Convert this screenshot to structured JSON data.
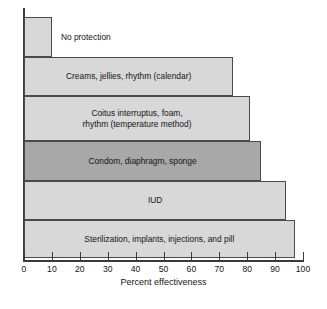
{
  "chart_data": {
    "type": "bar",
    "orientation": "horizontal",
    "title": "",
    "xlabel": "Percent effectiveness",
    "ylabel": "",
    "xlim": [
      0,
      100
    ],
    "xticks": [
      0,
      10,
      20,
      30,
      40,
      50,
      60,
      70,
      80,
      90,
      100
    ],
    "xtick_labels": [
      "0",
      "10",
      "20",
      "30",
      "40",
      "50",
      "60",
      "70",
      "80",
      "90",
      "100"
    ],
    "grid": false,
    "legend": "none",
    "categories": [
      "No protection",
      "Creams, jellies, rhythm (calendar)",
      "Coitus interruptus, foam,\nrhythm (temperature method)",
      "Condom, diaphragm, sponge",
      "IUD",
      "Sterilization, implants, injections, and pill"
    ],
    "values": [
      10,
      75,
      81,
      85,
      94,
      97
    ],
    "bars": [
      {
        "label": "No protection",
        "value": 10,
        "color": "#d8d8d8",
        "shade": "light",
        "label_position": "outside"
      },
      {
        "label": "Creams, jellies, rhythm (calendar)",
        "value": 75,
        "color": "#d8d8d8",
        "shade": "light",
        "label_position": "inside"
      },
      {
        "label": "Coitus interruptus, foam,\nrhythm (temperature method)",
        "value": 81,
        "color": "#d8d8d8",
        "shade": "light",
        "label_position": "inside"
      },
      {
        "label": "Condom, diaphragm, sponge",
        "value": 85,
        "color": "#a8a8a8",
        "shade": "dark",
        "label_position": "inside"
      },
      {
        "label": "IUD",
        "value": 94,
        "color": "#d8d8d8",
        "shade": "light",
        "label_position": "inside"
      },
      {
        "label": "Sterilization, implants, injections, and pill",
        "value": 97,
        "color": "#d8d8d8",
        "shade": "light",
        "label_position": "inside"
      }
    ]
  },
  "axis": {
    "x_title": "Percent effectiveness"
  },
  "caption": {
    "text": ""
  }
}
